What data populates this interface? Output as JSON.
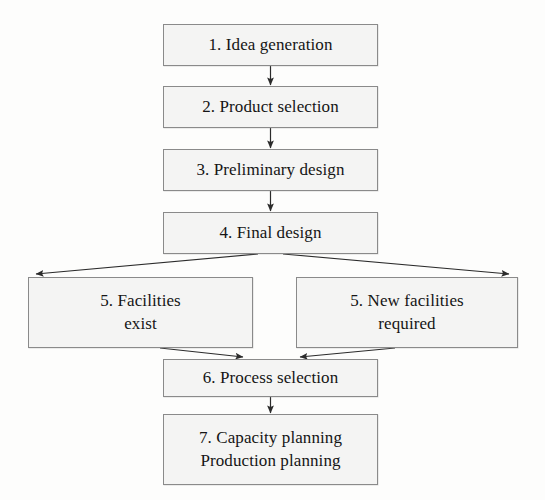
{
  "diagram": {
    "background_color": "#fdfdfc",
    "node_fill_color": "#f4f4f3",
    "node_border_color": "#8a8a8a",
    "text_color": "#151515",
    "edge_color": "#2b2b2b"
  },
  "nodes": [
    {
      "id": "idea-generation",
      "lines": [
        "1. Idea generation"
      ],
      "x": 163,
      "y": 24,
      "w": 215,
      "h": 42
    },
    {
      "id": "product-selection",
      "lines": [
        "2. Product selection"
      ],
      "x": 163,
      "y": 86,
      "w": 215,
      "h": 42
    },
    {
      "id": "preliminary-design",
      "lines": [
        "3. Preliminary design"
      ],
      "x": 163,
      "y": 149,
      "w": 215,
      "h": 42
    },
    {
      "id": "final-design",
      "lines": [
        "4. Final design"
      ],
      "x": 163,
      "y": 212,
      "w": 215,
      "h": 42
    },
    {
      "id": "facilities-exist",
      "lines": [
        "5. Facilities",
        "exist"
      ],
      "x": 28,
      "y": 277,
      "w": 225,
      "h": 71
    },
    {
      "id": "new-facilities-required",
      "lines": [
        "5. New facilities",
        "required"
      ],
      "x": 296,
      "y": 277,
      "w": 222,
      "h": 71
    },
    {
      "id": "process-selection",
      "lines": [
        "6. Process selection"
      ],
      "x": 163,
      "y": 359,
      "w": 215,
      "h": 38
    },
    {
      "id": "capacity-production-planning",
      "lines": [
        "7. Capacity planning",
        "Production planning"
      ],
      "x": 163,
      "y": 414,
      "w": 215,
      "h": 71
    }
  ],
  "edges": [
    {
      "id": "idea-to-product",
      "from": "idea-generation",
      "to": "product-selection",
      "type": "straight-down"
    },
    {
      "id": "product-to-preliminary",
      "from": "product-selection",
      "to": "preliminary-design",
      "type": "straight-down"
    },
    {
      "id": "preliminary-to-final",
      "from": "preliminary-design",
      "to": "final-design",
      "type": "straight-down"
    },
    {
      "id": "final-to-facilities-exist",
      "from": "final-design",
      "to": "facilities-exist",
      "type": "diagonal-left"
    },
    {
      "id": "final-to-new-facilities",
      "from": "final-design",
      "to": "new-facilities-required",
      "type": "diagonal-right"
    },
    {
      "id": "facilities-exist-to-process",
      "from": "facilities-exist",
      "to": "process-selection",
      "type": "diagonal-right"
    },
    {
      "id": "new-facilities-to-process",
      "from": "new-facilities-required",
      "to": "process-selection",
      "type": "diagonal-left"
    },
    {
      "id": "process-to-capacity",
      "from": "process-selection",
      "to": "capacity-production-planning",
      "type": "straight-down"
    }
  ]
}
